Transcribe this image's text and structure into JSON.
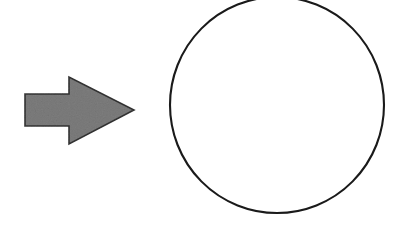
{
  "canvas": {
    "width": 408,
    "height": 228,
    "background_color": "#ffffff"
  },
  "diagram": {
    "shape_count": 2
  },
  "shapes": {
    "arrow": {
      "name": "right-block-arrow",
      "label": "",
      "fill_color": "#7d7d7d",
      "stroke_color": "#333333",
      "stroke_width": 1.6,
      "direction": "right",
      "texture": "noise",
      "bounds": {
        "x": 25,
        "y": 77,
        "width": 109,
        "height": 68
      },
      "tip_point": {
        "x": 134,
        "y": 110
      },
      "points": "25,94 69,94 69,77 134,110 69,144 69,126 25,126"
    },
    "circle": {
      "name": "outline-circle",
      "label": "",
      "fill_color": "none",
      "stroke_color": "#1a1a1a",
      "stroke_width": 2.1,
      "center": {
        "x": 277,
        "y": 105
      },
      "radius_x": 107,
      "radius_y": 108,
      "clipped_edge": "top"
    }
  }
}
